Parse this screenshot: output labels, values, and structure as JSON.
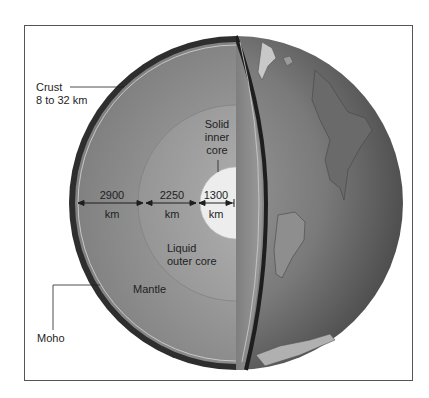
{
  "figure": {
    "labels": {
      "crust_name": "Crust",
      "crust_thickness": "8 to 32 km",
      "inner_core_line1": "Solid",
      "inner_core_line2": "inner",
      "inner_core_line3": "core",
      "outer_core_line1": "Liquid",
      "outer_core_line2": "outer core",
      "mantle": "Mantle",
      "moho": "Moho"
    },
    "dimensions": [
      {
        "value": "2900",
        "unit": "km"
      },
      {
        "value": "2250",
        "unit": "km"
      },
      {
        "value": "1300",
        "unit": "km"
      }
    ]
  },
  "colors": {
    "mantle": "#8a8a8a",
    "crust": "#3a3a3a",
    "inner_core": "#ececec",
    "exterior": "#6e6e6e",
    "frame": "#555555"
  }
}
